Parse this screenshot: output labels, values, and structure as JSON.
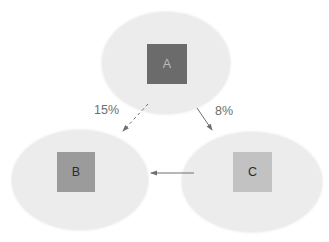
{
  "diagram": {
    "nodes": [
      {
        "id": "A",
        "label": "A",
        "box_color": "#6b6b6b",
        "label_color": "#bdbdbd"
      },
      {
        "id": "B",
        "label": "B",
        "box_color": "#9b9b9b",
        "label_color": "#2b2b2b"
      },
      {
        "id": "C",
        "label": "C",
        "box_color": "#c2c2c2",
        "label_color": "#2b2b2b"
      }
    ],
    "edges": [
      {
        "from": "A",
        "to": "B",
        "label": "15%",
        "style": "dashed"
      },
      {
        "from": "A",
        "to": "C",
        "label": "8%",
        "style": "solid"
      },
      {
        "from": "C",
        "to": "B",
        "label": "",
        "style": "solid"
      }
    ],
    "colors": {
      "background": "#ffffff",
      "ellipse_fill": "#ececec",
      "arrow": "#6f6f6f",
      "edge_label_text": "#6e6e6e"
    }
  }
}
